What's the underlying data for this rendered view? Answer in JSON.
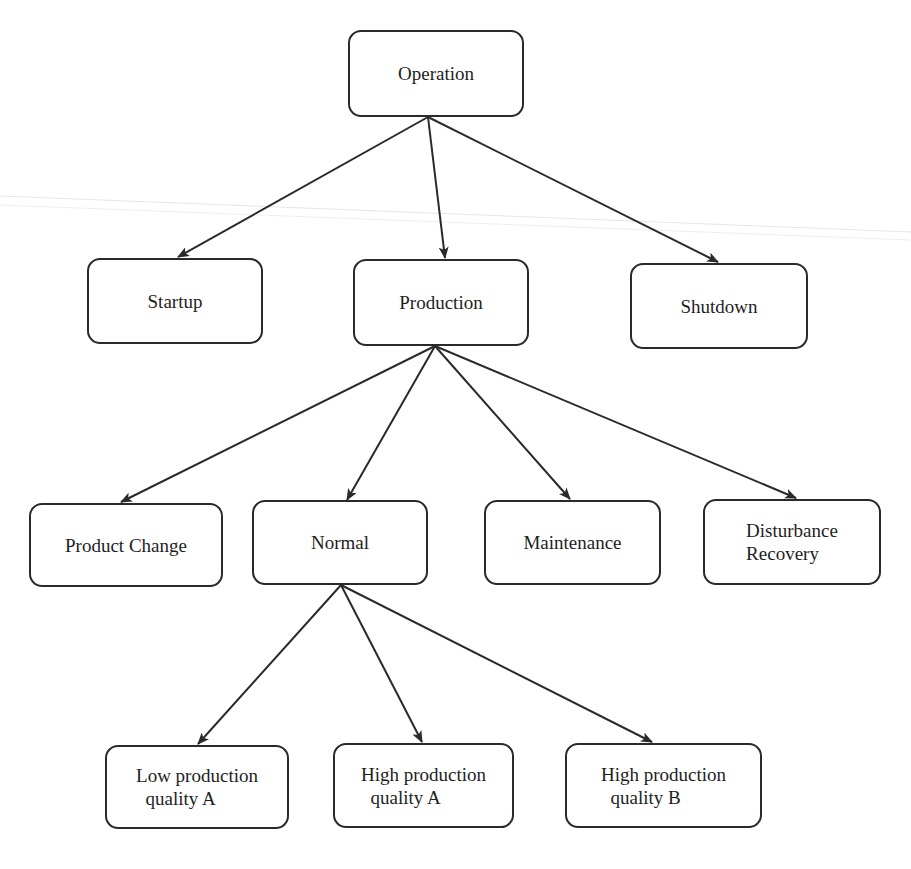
{
  "diagram": {
    "type": "tree",
    "title": "",
    "nodes": [
      {
        "id": "operation",
        "label": "Operation",
        "x": 348,
        "y": 30,
        "w": 176,
        "h": 87
      },
      {
        "id": "startup",
        "label": "Startup",
        "x": 87,
        "y": 258,
        "w": 176,
        "h": 86
      },
      {
        "id": "production",
        "label": "Production",
        "x": 353,
        "y": 259,
        "w": 176,
        "h": 87
      },
      {
        "id": "shutdown",
        "label": "Shutdown",
        "x": 630,
        "y": 263,
        "w": 178,
        "h": 86
      },
      {
        "id": "product_change",
        "label": "Product Change",
        "x": 29,
        "y": 503,
        "w": 194,
        "h": 84
      },
      {
        "id": "normal",
        "label": "Normal",
        "x": 252,
        "y": 500,
        "w": 176,
        "h": 85
      },
      {
        "id": "maintenance",
        "label": "Maintenance",
        "x": 484,
        "y": 500,
        "w": 177,
        "h": 85
      },
      {
        "id": "disturbance_recovery",
        "label": "Disturbance\nRecovery",
        "x": 703,
        "y": 499,
        "w": 178,
        "h": 86
      },
      {
        "id": "low_prod_a",
        "label": "Low production\n  quality A",
        "x": 105,
        "y": 745,
        "w": 184,
        "h": 84
      },
      {
        "id": "high_prod_a",
        "label": "High production\n  quality A",
        "x": 333,
        "y": 743,
        "w": 181,
        "h": 85
      },
      {
        "id": "high_prod_b",
        "label": "High production\n  quality B",
        "x": 565,
        "y": 743,
        "w": 197,
        "h": 85
      }
    ],
    "edges": [
      {
        "from": "operation",
        "to": "startup",
        "x1": 428,
        "y1": 117,
        "x2": 178,
        "y2": 257
      },
      {
        "from": "operation",
        "to": "production",
        "x1": 428,
        "y1": 117,
        "x2": 445,
        "y2": 258
      },
      {
        "from": "operation",
        "to": "shutdown",
        "x1": 428,
        "y1": 117,
        "x2": 718,
        "y2": 262
      },
      {
        "from": "production",
        "to": "product_change",
        "x1": 435,
        "y1": 346,
        "x2": 121,
        "y2": 502
      },
      {
        "from": "production",
        "to": "normal",
        "x1": 435,
        "y1": 346,
        "x2": 347,
        "y2": 500
      },
      {
        "from": "production",
        "to": "maintenance",
        "x1": 435,
        "y1": 346,
        "x2": 570,
        "y2": 499
      },
      {
        "from": "production",
        "to": "disturbance_recovery",
        "x1": 435,
        "y1": 346,
        "x2": 796,
        "y2": 498
      },
      {
        "from": "normal",
        "to": "low_prod_a",
        "x1": 341,
        "y1": 585,
        "x2": 198,
        "y2": 744
      },
      {
        "from": "normal",
        "to": "high_prod_a",
        "x1": 341,
        "y1": 585,
        "x2": 422,
        "y2": 742
      },
      {
        "from": "normal",
        "to": "high_prod_b",
        "x1": 341,
        "y1": 585,
        "x2": 652,
        "y2": 742
      }
    ],
    "colors": {
      "stroke": "#2a2a2a",
      "text": "#1e1e1e",
      "background": "#ffffff",
      "scan_line": "#e3e3e3"
    }
  }
}
